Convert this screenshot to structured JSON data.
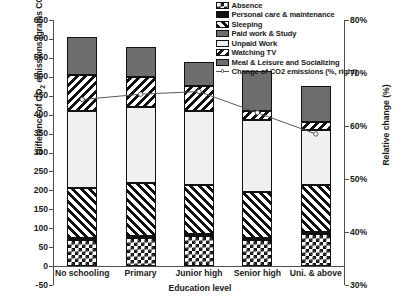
{
  "chart_data": {
    "type": "bar",
    "subtype": "stacked-bar-with-line",
    "title": "",
    "xlabel": "Education level",
    "ylabel": "Difference of CO2 emissions (grams CO2/day)",
    "ylabel_right": "Relative change (%)",
    "categories": [
      "No schooling",
      "Primary",
      "Junior high",
      "Senior high",
      "Uni. & above"
    ],
    "ylim": [
      -50,
      650
    ],
    "yticks": [
      -50,
      0,
      50,
      100,
      150,
      200,
      250,
      300,
      350,
      400,
      450,
      500,
      550,
      600,
      650
    ],
    "ytick_labels": [
      "-50",
      "0",
      "50",
      "100",
      "150",
      "200",
      "250",
      "300",
      "350",
      "400",
      "450",
      "500",
      "550",
      "600",
      "650"
    ],
    "ylim_right": [
      30,
      80
    ],
    "yticks_right": [
      30,
      40,
      50,
      60,
      70,
      80
    ],
    "ytick_labels_right": [
      "30%",
      "40%",
      "50%",
      "60%",
      "70%",
      "80%"
    ],
    "grid": false,
    "legend_position": "top-right",
    "series": [
      {
        "name": "Absence",
        "pattern": "checkerboard",
        "values": [
          70,
          75,
          80,
          70,
          85
        ]
      },
      {
        "name": "Personal care & maintenance",
        "pattern": "solid-black",
        "values": [
          5,
          5,
          5,
          5,
          5
        ]
      },
      {
        "name": "Sleeping",
        "pattern": "diagonal-up-stripes",
        "values": [
          130,
          140,
          130,
          120,
          125
        ]
      },
      {
        "name": "Paid work & Study",
        "pattern": "solid-dark-gray",
        "values": [
          0,
          0,
          0,
          0,
          0
        ]
      },
      {
        "name": "Unpaid Work",
        "pattern": "light-gray",
        "values": [
          205,
          200,
          195,
          190,
          145
        ]
      },
      {
        "name": "Watching TV",
        "pattern": "diagonal-down-stripes",
        "values": [
          95,
          80,
          65,
          25,
          20
        ]
      },
      {
        "name": "Meal & Leisure and Socializing",
        "pattern": "solid-dark-gray",
        "values": [
          100,
          78,
          65,
          105,
          95
        ]
      }
    ],
    "line_series": {
      "name": "Change of CO2 emissions (%, right)",
      "axis": "right",
      "marker": "open-circle",
      "values": [
        65.0,
        66.0,
        66.5,
        62.5,
        58.5
      ]
    },
    "bar_totals": [
      605,
      578,
      540,
      515,
      475
    ]
  },
  "legend": {
    "items": [
      "Absence",
      "Personal care & maintenance",
      "Sleeping",
      "Paid work & Study",
      "Unpaid Work",
      "Watching TV",
      "Meal & Leisure and Socializing",
      "Change of CO2 emissions (%, right)"
    ]
  }
}
